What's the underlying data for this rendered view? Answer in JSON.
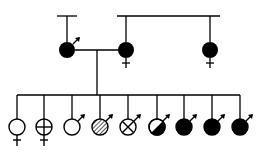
{
  "diagram": {
    "type": "pedigree",
    "colors": {
      "ink": "#000000",
      "background": "#ffffff"
    },
    "parents": [
      {
        "id": "father",
        "sex": "male",
        "fill": "solid"
      },
      {
        "id": "mother",
        "sex": "female",
        "fill": "solid"
      },
      {
        "id": "mother-sister",
        "sex": "female",
        "fill": "solid"
      }
    ],
    "children": [
      {
        "sex": "female",
        "fill": "empty"
      },
      {
        "sex": "female",
        "fill": "cross"
      },
      {
        "sex": "male",
        "fill": "empty"
      },
      {
        "sex": "male",
        "fill": "hatched"
      },
      {
        "sex": "male",
        "fill": "x-mark"
      },
      {
        "sex": "male",
        "fill": "half-diagonal"
      },
      {
        "sex": "male",
        "fill": "solid"
      },
      {
        "sex": "male",
        "fill": "solid"
      },
      {
        "sex": "male",
        "fill": "solid"
      }
    ]
  }
}
